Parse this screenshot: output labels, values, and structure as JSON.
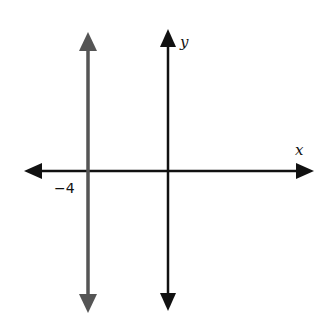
{
  "diagram": {
    "type": "coordinate-plane",
    "axes": {
      "x_label": "x",
      "y_label": "y"
    },
    "lines": [
      {
        "name": "vertical-line",
        "equation": "x = -4",
        "color": "#555555"
      }
    ],
    "tick_labels": [
      {
        "value": -4,
        "text": "−4"
      }
    ],
    "colors": {
      "axes": "#111111",
      "line": "#555555"
    }
  }
}
